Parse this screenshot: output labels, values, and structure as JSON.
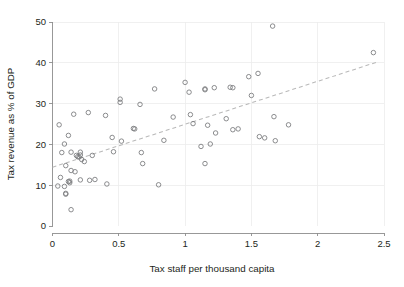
{
  "chart_data": {
    "type": "scatter",
    "title": "",
    "xlabel": "Tax staff per thousand capita",
    "ylabel": "Tax revenue as % of GDP",
    "xlim": [
      0,
      2.5
    ],
    "ylim": [
      0,
      50
    ],
    "xticks": [
      0,
      0.5,
      1,
      1.5,
      2,
      2.5
    ],
    "xtick_labels": [
      "0",
      "0.5",
      "1",
      "1.5",
      "2",
      "2.5"
    ],
    "yticks": [
      0,
      10,
      20,
      30,
      40,
      50
    ],
    "ytick_labels": [
      "0",
      "10",
      "20",
      "30",
      "40",
      "50"
    ],
    "grid": true,
    "legend": null,
    "marker": "open-circle",
    "marker_color": "#77787b",
    "trendline": {
      "style": "dashed",
      "color": "#b9b9b9",
      "x_start": 0.0,
      "y_start": 14.4,
      "x_end": 2.45,
      "y_end": 40.2
    },
    "points": [
      {
        "x": 0.04,
        "y": 9.8
      },
      {
        "x": 0.05,
        "y": 24.8
      },
      {
        "x": 0.06,
        "y": 11.9
      },
      {
        "x": 0.07,
        "y": 18.0
      },
      {
        "x": 0.09,
        "y": 20.1
      },
      {
        "x": 0.09,
        "y": 9.7
      },
      {
        "x": 0.1,
        "y": 14.8
      },
      {
        "x": 0.1,
        "y": 8.0
      },
      {
        "x": 0.1,
        "y": 7.8
      },
      {
        "x": 0.12,
        "y": 22.2
      },
      {
        "x": 0.12,
        "y": 10.9
      },
      {
        "x": 0.13,
        "y": 11.0
      },
      {
        "x": 0.13,
        "y": 10.6
      },
      {
        "x": 0.14,
        "y": 18.1
      },
      {
        "x": 0.14,
        "y": 13.6
      },
      {
        "x": 0.14,
        "y": 4.0
      },
      {
        "x": 0.16,
        "y": 27.4
      },
      {
        "x": 0.17,
        "y": 13.3
      },
      {
        "x": 0.18,
        "y": 17.3
      },
      {
        "x": 0.19,
        "y": 17.0
      },
      {
        "x": 0.2,
        "y": 16.9
      },
      {
        "x": 0.21,
        "y": 18.1
      },
      {
        "x": 0.21,
        "y": 17.4
      },
      {
        "x": 0.21,
        "y": 11.3
      },
      {
        "x": 0.22,
        "y": 16.3
      },
      {
        "x": 0.24,
        "y": 15.8
      },
      {
        "x": 0.27,
        "y": 27.8
      },
      {
        "x": 0.28,
        "y": 11.2
      },
      {
        "x": 0.3,
        "y": 17.3
      },
      {
        "x": 0.32,
        "y": 11.4
      },
      {
        "x": 0.4,
        "y": 27.1
      },
      {
        "x": 0.41,
        "y": 10.3
      },
      {
        "x": 0.45,
        "y": 21.7
      },
      {
        "x": 0.46,
        "y": 18.2
      },
      {
        "x": 0.51,
        "y": 30.3
      },
      {
        "x": 0.51,
        "y": 31.1
      },
      {
        "x": 0.52,
        "y": 20.8
      },
      {
        "x": 0.61,
        "y": 23.9
      },
      {
        "x": 0.62,
        "y": 23.8
      },
      {
        "x": 0.66,
        "y": 29.8
      },
      {
        "x": 0.67,
        "y": 18.0
      },
      {
        "x": 0.68,
        "y": 15.3
      },
      {
        "x": 0.77,
        "y": 33.6
      },
      {
        "x": 0.8,
        "y": 10.1
      },
      {
        "x": 0.84,
        "y": 21.0
      },
      {
        "x": 0.91,
        "y": 26.7
      },
      {
        "x": 1.0,
        "y": 35.2
      },
      {
        "x": 1.03,
        "y": 32.8
      },
      {
        "x": 1.04,
        "y": 27.3
      },
      {
        "x": 1.06,
        "y": 25.1
      },
      {
        "x": 1.12,
        "y": 19.5
      },
      {
        "x": 1.15,
        "y": 33.4
      },
      {
        "x": 1.15,
        "y": 33.6
      },
      {
        "x": 1.15,
        "y": 15.3
      },
      {
        "x": 1.17,
        "y": 24.7
      },
      {
        "x": 1.19,
        "y": 20.1
      },
      {
        "x": 1.22,
        "y": 33.9
      },
      {
        "x": 1.23,
        "y": 22.8
      },
      {
        "x": 1.31,
        "y": 26.3
      },
      {
        "x": 1.34,
        "y": 34.0
      },
      {
        "x": 1.36,
        "y": 33.9
      },
      {
        "x": 1.36,
        "y": 23.6
      },
      {
        "x": 1.4,
        "y": 23.8
      },
      {
        "x": 1.48,
        "y": 36.6
      },
      {
        "x": 1.5,
        "y": 32.0
      },
      {
        "x": 1.55,
        "y": 37.4
      },
      {
        "x": 1.56,
        "y": 21.9
      },
      {
        "x": 1.6,
        "y": 21.6
      },
      {
        "x": 1.66,
        "y": 49.0
      },
      {
        "x": 1.67,
        "y": 26.8
      },
      {
        "x": 1.68,
        "y": 20.9
      },
      {
        "x": 1.78,
        "y": 24.8
      },
      {
        "x": 2.42,
        "y": 42.5
      }
    ]
  }
}
